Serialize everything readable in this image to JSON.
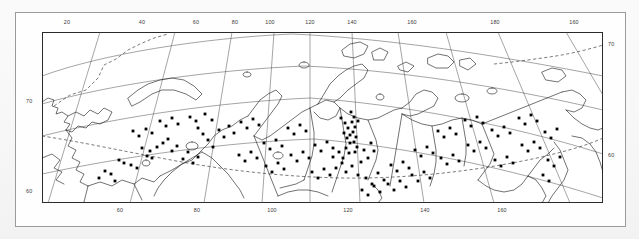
{
  "figure": {
    "kind": "map",
    "region_title": "Northern Eurasia / Siberia distribution map",
    "projection": "conic",
    "colors": {
      "background": "#fdfdfd",
      "frame": "#9a9a9a",
      "coastline": "#1a1a1a",
      "graticule": "#444444",
      "boundary_dashed": "#333333",
      "point_marker": "#000000"
    }
  },
  "axes": {
    "top_labels": [
      {
        "text": "20",
        "x": 67
      },
      {
        "text": "40",
        "x": 142
      },
      {
        "text": "60",
        "x": 196
      },
      {
        "text": "80",
        "x": 235
      },
      {
        "text": "100",
        "x": 270
      },
      {
        "text": "120",
        "x": 310
      },
      {
        "text": "140",
        "x": 352
      },
      {
        "text": "160",
        "x": 412
      },
      {
        "text": "180",
        "x": 495
      },
      {
        "text": "160",
        "x": 574
      }
    ],
    "bottom_labels": [
      {
        "text": "60",
        "x": 120
      },
      {
        "text": "80",
        "x": 197
      },
      {
        "text": "100",
        "x": 272
      },
      {
        "text": "120",
        "x": 348
      },
      {
        "text": "140",
        "x": 425
      },
      {
        "text": "160",
        "x": 502
      }
    ],
    "left_labels": [
      {
        "text": "70",
        "y": 101
      },
      {
        "text": "60",
        "y": 191
      }
    ],
    "right_labels": [
      {
        "text": "70",
        "y": 44
      },
      {
        "text": "60",
        "y": 155
      }
    ]
  },
  "chart_data": {
    "type": "scatter",
    "title": "",
    "xlabel": "Longitude (°E)",
    "ylabel": "Latitude (°N)",
    "xlim": [
      15,
      200
    ],
    "ylim": [
      52,
      80
    ],
    "grid": true,
    "legend": "none",
    "series": [
      {
        "name": "sample localities",
        "marker": "filled-square",
        "color": "#000000",
        "points": [
          [
            142,
            148
          ],
          [
            150,
            151
          ],
          [
            157,
            147
          ],
          [
            147,
            156
          ],
          [
            152,
            158
          ],
          [
            119,
            160
          ],
          [
            124,
            163
          ],
          [
            131,
            165
          ],
          [
            137,
            168
          ],
          [
            105,
            171
          ],
          [
            111,
            174
          ],
          [
            99,
            178
          ],
          [
            115,
            181
          ],
          [
            163,
            143
          ],
          [
            168,
            139
          ],
          [
            172,
            151
          ],
          [
            177,
            146
          ],
          [
            183,
            159
          ],
          [
            188,
            152
          ],
          [
            193,
            163
          ],
          [
            198,
            157
          ],
          [
            203,
            134
          ],
          [
            208,
            140
          ],
          [
            213,
            147
          ],
          [
            198,
            128
          ],
          [
            219,
            130
          ],
          [
            224,
            137
          ],
          [
            229,
            126
          ],
          [
            234,
            133
          ],
          [
            190,
            117
          ],
          [
            196,
            121
          ],
          [
            205,
            114
          ],
          [
            212,
            120
          ],
          [
            160,
            121
          ],
          [
            166,
            126
          ],
          [
            172,
            118
          ],
          [
            178,
            124
          ],
          [
            146,
            129
          ],
          [
            152,
            133
          ],
          [
            139,
            136
          ],
          [
            133,
            131
          ],
          [
            241,
            122
          ],
          [
            247,
            128
          ],
          [
            253,
            119
          ],
          [
            259,
            125
          ],
          [
            239,
            155
          ],
          [
            245,
            161
          ],
          [
            251,
            152
          ],
          [
            257,
            158
          ],
          [
            264,
            143
          ],
          [
            270,
            149
          ],
          [
            276,
            140
          ],
          [
            282,
            146
          ],
          [
            266,
            166
          ],
          [
            272,
            172
          ],
          [
            278,
            163
          ],
          [
            284,
            169
          ],
          [
            291,
            155
          ],
          [
            297,
            161
          ],
          [
            303,
            152
          ],
          [
            309,
            158
          ],
          [
            288,
            128
          ],
          [
            294,
            134
          ],
          [
            300,
            125
          ],
          [
            306,
            131
          ],
          [
            315,
            145
          ],
          [
            321,
            151
          ],
          [
            327,
            142
          ],
          [
            333,
            148
          ],
          [
            312,
            172
          ],
          [
            318,
            178
          ],
          [
            324,
            169
          ],
          [
            330,
            175
          ],
          [
            341,
            118
          ],
          [
            345,
            123
          ],
          [
            348,
            128
          ],
          [
            344,
            133
          ],
          [
            347,
            138
          ],
          [
            350,
            143
          ],
          [
            346,
            148
          ],
          [
            349,
            153
          ],
          [
            343,
            158
          ],
          [
            351,
            112
          ],
          [
            354,
            117
          ],
          [
            352,
            122
          ],
          [
            355,
            127
          ],
          [
            353,
            132
          ],
          [
            356,
            137
          ],
          [
            354,
            142
          ],
          [
            357,
            147
          ],
          [
            355,
            152
          ],
          [
            358,
            121
          ],
          [
            350,
            135
          ],
          [
            339,
            152
          ],
          [
            342,
            163
          ],
          [
            336,
            168
          ],
          [
            333,
            157
          ],
          [
            346,
            172
          ],
          [
            352,
            166
          ],
          [
            358,
            175
          ],
          [
            361,
            162
          ],
          [
            364,
            150
          ],
          [
            368,
            158
          ],
          [
            371,
            143
          ],
          [
            374,
            151
          ],
          [
            366,
            178
          ],
          [
            372,
            184
          ],
          [
            378,
            173
          ],
          [
            384,
            180
          ],
          [
            362,
            190
          ],
          [
            368,
            195
          ],
          [
            374,
            186
          ],
          [
            380,
            192
          ],
          [
            391,
            165
          ],
          [
            397,
            171
          ],
          [
            403,
            162
          ],
          [
            409,
            168
          ],
          [
            388,
            184
          ],
          [
            394,
            190
          ],
          [
            400,
            181
          ],
          [
            406,
            187
          ],
          [
            415,
            150
          ],
          [
            421,
            156
          ],
          [
            427,
            147
          ],
          [
            433,
            153
          ],
          [
            412,
            175
          ],
          [
            418,
            181
          ],
          [
            424,
            172
          ],
          [
            430,
            178
          ],
          [
            438,
            131
          ],
          [
            444,
            137
          ],
          [
            450,
            128
          ],
          [
            456,
            134
          ],
          [
            441,
            158
          ],
          [
            447,
            164
          ],
          [
            453,
            155
          ],
          [
            459,
            161
          ],
          [
            465,
            120
          ],
          [
            471,
            126
          ],
          [
            477,
            117
          ],
          [
            483,
            123
          ],
          [
            468,
            145
          ],
          [
            474,
            151
          ],
          [
            480,
            142
          ],
          [
            486,
            148
          ],
          [
            492,
            130
          ],
          [
            498,
            136
          ],
          [
            504,
            127
          ],
          [
            510,
            133
          ],
          [
            495,
            160
          ],
          [
            501,
            166
          ],
          [
            507,
            157
          ],
          [
            513,
            163
          ],
          [
            519,
            118
          ],
          [
            525,
            124
          ],
          [
            531,
            115
          ],
          [
            537,
            121
          ],
          [
            522,
            145
          ],
          [
            528,
            151
          ],
          [
            534,
            142
          ],
          [
            540,
            148
          ],
          [
            545,
            132
          ],
          [
            551,
            138
          ],
          [
            557,
            129
          ],
          [
            548,
            160
          ],
          [
            554,
            166
          ],
          [
            560,
            157
          ],
          [
            543,
            175
          ],
          [
            549,
            181
          ]
        ]
      }
    ]
  }
}
